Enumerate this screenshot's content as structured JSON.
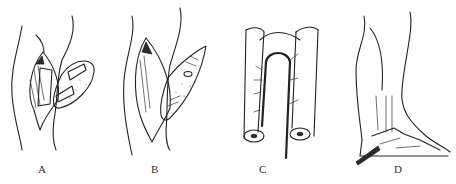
{
  "figure": {
    "panels": [
      {
        "id": "A",
        "label": "A",
        "subject": "thigh incision with rolled flap"
      },
      {
        "id": "B",
        "label": "B",
        "subject": "thigh incision with opened flap"
      },
      {
        "id": "C",
        "label": "C",
        "subject": "U-shaped tubed flap with vascular pedicle"
      },
      {
        "id": "D",
        "label": "D",
        "subject": "lower leg and foot with tube inserted at heel"
      }
    ],
    "colors": {
      "ink": "#222222",
      "background": "#ffffff"
    }
  }
}
